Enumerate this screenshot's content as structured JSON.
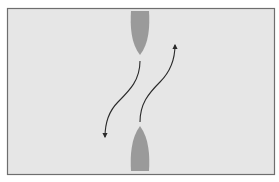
{
  "diagram": {
    "type": "vessels-meeting-head-on",
    "colors": {
      "background": "#e6e6e6",
      "frame": "#6e6e6e",
      "vessel": "#9a9a9a",
      "arrow": "#2a2a2a"
    },
    "vessels": [
      {
        "id": "vessel-north",
        "heading": "south",
        "cx": 140,
        "top": 11,
        "bottom": 55,
        "width": 19
      },
      {
        "id": "vessel-south",
        "heading": "north",
        "cx": 140,
        "top": 126,
        "bottom": 171,
        "width": 19
      }
    ],
    "arrows": [
      {
        "id": "course-north-vessel",
        "direction": "down-left",
        "from": [
          140,
          61
        ],
        "to": [
          104,
          138
        ]
      },
      {
        "id": "course-south-vessel",
        "direction": "up-right",
        "from": [
          140,
          122
        ],
        "to": [
          175,
          44
        ]
      }
    ]
  }
}
